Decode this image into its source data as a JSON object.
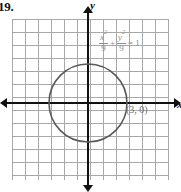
{
  "figure": {
    "problem_number": "19.",
    "width": 181,
    "height": 192
  },
  "axes": {
    "y_label": "y",
    "x_label": "x",
    "origin_px": {
      "x": 88,
      "y": 103
    },
    "grid": {
      "columns": 12,
      "rows": 12,
      "cell_px": 13,
      "color": "#a8a8a8"
    },
    "axis_color": "#111111"
  },
  "equation": {
    "x_numerator": "x",
    "x_exponent": "2",
    "x_denominator": "9",
    "operator": "+",
    "y_numerator": "y",
    "y_exponent": "2",
    "y_denominator": "9",
    "equals": "=",
    "right_side": "1",
    "plain_text": "x²/9 + y²/9 = 1",
    "color": "#8d8d8d"
  },
  "annotations": {
    "point_label": "(3, 0)",
    "point_color": "#6f6f6f"
  },
  "chart_data": {
    "type": "line",
    "title": "",
    "subtitle": "",
    "xlabel": "x",
    "ylabel": "y",
    "xlim": [
      -6,
      6
    ],
    "ylim": [
      -6,
      6
    ],
    "grid": true,
    "legend": null,
    "curve": {
      "name": "circle",
      "equation": "x^2/9 + y^2/9 = 1",
      "shape": "circle",
      "center": [
        0,
        0
      ],
      "radius": 3,
      "semi_axis_x": 3,
      "semi_axis_y": 3,
      "color": "#5a5a5a"
    },
    "annotations": [
      {
        "label": "(3, 0)",
        "x": 3,
        "y": 0
      }
    ],
    "intercepts": {
      "x": [
        -3,
        3
      ],
      "y": [
        -3,
        3
      ]
    }
  }
}
